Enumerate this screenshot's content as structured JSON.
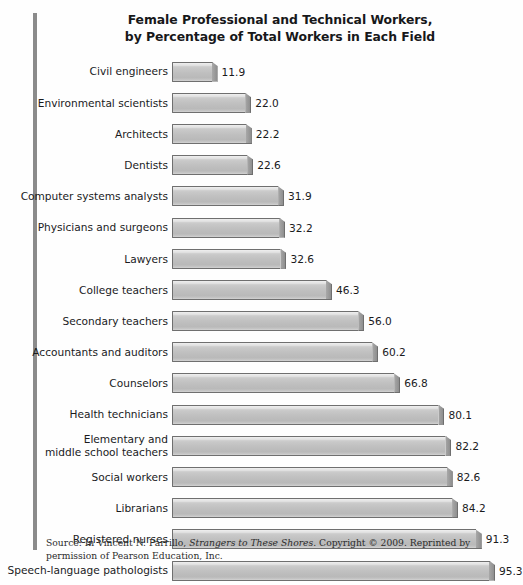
{
  "chart_data": {
    "type": "bar",
    "orientation": "horizontal",
    "title_lines": [
      "Female Professional and Technical Workers,",
      "by Percentage of Total Workers in Each Field"
    ],
    "xlabel": "",
    "ylabel": "",
    "xlim": [
      0,
      100
    ],
    "grid": false,
    "legend": false,
    "value_format": "one-decimal percentage",
    "categories": [
      "Civil engineers",
      "Environmental scientists",
      "Architects",
      "Dentists",
      "Computer systems analysts",
      "Physicians and surgeons",
      "Lawyers",
      "College teachers",
      "Secondary teachers",
      "Accountants and auditors",
      "Counselors",
      "Health technicians",
      "Elementary and middle school teachers",
      "Social workers",
      "Librarians",
      "Registered nurses",
      "Speech-language pathologists"
    ],
    "values": [
      11.9,
      22.0,
      22.2,
      22.6,
      31.9,
      32.2,
      32.6,
      46.3,
      56.0,
      60.2,
      66.8,
      80.1,
      82.2,
      82.6,
      84.2,
      91.3,
      95.3
    ],
    "value_labels": [
      "11.9",
      "22.0",
      "22.2",
      "22.6",
      "31.9",
      "32.2",
      "32.6",
      "46.3",
      "56.0",
      "60.2",
      "66.8",
      "80.1",
      "82.2",
      "82.6",
      "84.2",
      "91.3",
      "95.3"
    ],
    "rows": [
      {
        "label_lines": [
          "Civil engineers"
        ],
        "value": 11.9,
        "value_label": "11.9"
      },
      {
        "label_lines": [
          "Environmental scientists"
        ],
        "value": 22.0,
        "value_label": "22.0"
      },
      {
        "label_lines": [
          "Architects"
        ],
        "value": 22.2,
        "value_label": "22.2"
      },
      {
        "label_lines": [
          "Dentists"
        ],
        "value": 22.6,
        "value_label": "22.6"
      },
      {
        "label_lines": [
          "Computer systems analysts"
        ],
        "value": 31.9,
        "value_label": "31.9"
      },
      {
        "label_lines": [
          "Physicians and surgeons"
        ],
        "value": 32.2,
        "value_label": "32.2"
      },
      {
        "label_lines": [
          "Lawyers"
        ],
        "value": 32.6,
        "value_label": "32.6"
      },
      {
        "label_lines": [
          "College teachers"
        ],
        "value": 46.3,
        "value_label": "46.3"
      },
      {
        "label_lines": [
          "Secondary teachers"
        ],
        "value": 56.0,
        "value_label": "56.0"
      },
      {
        "label_lines": [
          "Accountants and auditors"
        ],
        "value": 60.2,
        "value_label": "60.2"
      },
      {
        "label_lines": [
          "Counselors"
        ],
        "value": 66.8,
        "value_label": "66.8"
      },
      {
        "label_lines": [
          "Health technicians"
        ],
        "value": 80.1,
        "value_label": "80.1"
      },
      {
        "label_lines": [
          "Elementary and",
          "middle school teachers"
        ],
        "value": 82.2,
        "value_label": "82.2"
      },
      {
        "label_lines": [
          "Social workers"
        ],
        "value": 82.6,
        "value_label": "82.6"
      },
      {
        "label_lines": [
          "Librarians"
        ],
        "value": 84.2,
        "value_label": "84.2"
      },
      {
        "label_lines": [
          "Registered nurses"
        ],
        "value": 91.3,
        "value_label": "91.3"
      },
      {
        "label_lines": [
          "Speech-language pathologists"
        ],
        "value": 95.3,
        "value_label": "95.3"
      }
    ],
    "colors": {
      "bar_fill": "#c2c2c2",
      "bar_outline": "#6f6f6f",
      "bar_side": "#9a9a9a",
      "text": "#1a1b1d",
      "background": "#ffffff",
      "left_rule": "#8b8b8b"
    }
  },
  "source": {
    "prefix": "Source: In Vincent N. Parrillo, ",
    "work_title": "Strangers to These Shores",
    "suffix": ". Copyright © 2009. Reprinted by permission of Pearson Education, Inc."
  }
}
